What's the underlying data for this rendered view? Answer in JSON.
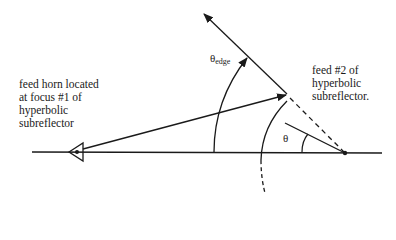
{
  "labels": {
    "feed_horn": [
      "feed horn located",
      "at focus #1 of",
      "hyperbolic",
      "subreflector"
    ],
    "feed2": [
      "feed #2 of",
      "hyperbolic",
      "subreflector."
    ],
    "theta_edge": {
      "symbol": "θ",
      "subscript": "edge"
    },
    "theta": "θ"
  },
  "colors": {
    "line": "#1a1a1a",
    "background": "#ffffff"
  }
}
